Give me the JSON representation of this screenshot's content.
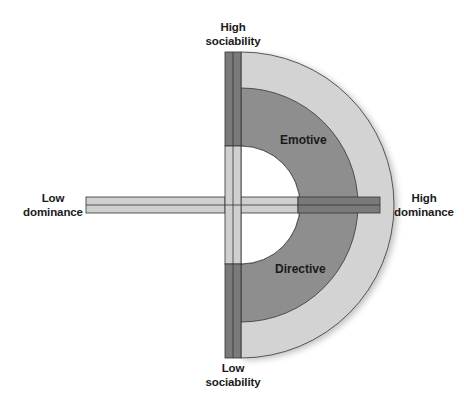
{
  "diagram": {
    "axes": {
      "top": {
        "line1": "High",
        "line2": "sociability"
      },
      "bottom": {
        "line1": "Low",
        "line2": "sociability"
      },
      "left": {
        "line1": "Low",
        "line2": "dominance"
      },
      "right": {
        "line1": "High",
        "line2": "dominance"
      }
    },
    "regions": [
      {
        "label": "Emotive"
      },
      {
        "label": "Directive"
      }
    ],
    "colors": {
      "outer_ring": "#d3d3d3",
      "inner_band": "#8e8e8e",
      "bar_light": "#cfcfcf",
      "bar_dark": "#7a7a7a",
      "stroke": "#333333"
    }
  }
}
